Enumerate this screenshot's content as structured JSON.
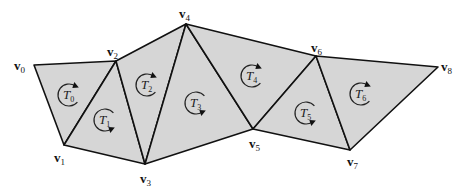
{
  "diagram": {
    "type": "triangle-strip",
    "fill_color": "#d6d6d6",
    "stroke_color": "#111111",
    "vertices": [
      {
        "id": "v0",
        "base": "v",
        "sub": "0",
        "x": 34,
        "y": 65,
        "lx": 14,
        "ly": 70
      },
      {
        "id": "v1",
        "base": "v",
        "sub": "1",
        "x": 64,
        "y": 145,
        "lx": 54,
        "ly": 162
      },
      {
        "id": "v2",
        "base": "v",
        "sub": "2",
        "x": 116,
        "y": 61,
        "lx": 107,
        "ly": 56
      },
      {
        "id": "v3",
        "base": "v",
        "sub": "3",
        "x": 145,
        "y": 164,
        "lx": 140,
        "ly": 183
      },
      {
        "id": "v4",
        "base": "v",
        "sub": "4",
        "x": 186,
        "y": 24,
        "lx": 179,
        "ly": 18
      },
      {
        "id": "v5",
        "base": "v",
        "sub": "5",
        "x": 253,
        "y": 129,
        "lx": 249,
        "ly": 148
      },
      {
        "id": "v6",
        "base": "v",
        "sub": "6",
        "x": 316,
        "y": 56,
        "lx": 311,
        "ly": 52
      },
      {
        "id": "v7",
        "base": "v",
        "sub": "7",
        "x": 350,
        "y": 150,
        "lx": 347,
        "ly": 166
      },
      {
        "id": "v8",
        "base": "v",
        "sub": "8",
        "x": 438,
        "y": 67,
        "lx": 441,
        "ly": 71
      }
    ],
    "triangles": [
      {
        "id": "T0",
        "base": "T",
        "sub": "0",
        "verts": [
          0,
          1,
          2
        ],
        "cx": 69,
        "cy": 95,
        "arrow": "up"
      },
      {
        "id": "T1",
        "base": "T",
        "sub": "1",
        "verts": [
          1,
          2,
          3
        ],
        "cx": 105,
        "cy": 120,
        "arrow": "down"
      },
      {
        "id": "T2",
        "base": "T",
        "sub": "2",
        "verts": [
          2,
          3,
          4
        ],
        "cx": 147,
        "cy": 85,
        "arrow": "up"
      },
      {
        "id": "T3",
        "base": "T",
        "sub": "3",
        "verts": [
          3,
          4,
          5
        ],
        "cx": 196,
        "cy": 103,
        "arrow": "down"
      },
      {
        "id": "T4",
        "base": "T",
        "sub": "4",
        "verts": [
          4,
          5,
          6
        ],
        "cx": 252,
        "cy": 76,
        "arrow": "up"
      },
      {
        "id": "T5",
        "base": "T",
        "sub": "5",
        "verts": [
          5,
          6,
          7
        ],
        "cx": 306,
        "cy": 113,
        "arrow": "down"
      },
      {
        "id": "T6",
        "base": "T",
        "sub": "6",
        "verts": [
          6,
          7,
          8
        ],
        "cx": 361,
        "cy": 94,
        "arrow": "up"
      }
    ]
  }
}
